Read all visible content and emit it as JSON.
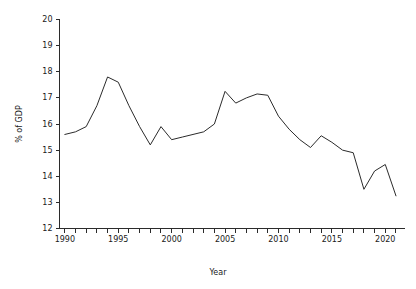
{
  "chart_data": {
    "type": "line",
    "title": "",
    "xlabel": "Year",
    "ylabel": "% of GDP",
    "xlim": [
      1989.5,
      2021.8
    ],
    "ylim": [
      12,
      20
    ],
    "grid": false,
    "legend": "none",
    "x_tick_labels": [
      "1990",
      "1995",
      "2000",
      "2005",
      "2010",
      "2015",
      "2020"
    ],
    "x_tick_label_values": [
      1990,
      1995,
      2000,
      2005,
      2010,
      2015,
      2020
    ],
    "x_minor_ticks": [
      1990,
      1991,
      1992,
      1993,
      1994,
      1995,
      1996,
      1997,
      1998,
      1999,
      2000,
      2001,
      2002,
      2003,
      2004,
      2005,
      2006,
      2007,
      2008,
      2009,
      2010,
      2011,
      2012,
      2013,
      2014,
      2015,
      2016,
      2017,
      2018,
      2019,
      2020,
      2021
    ],
    "y_tick_labels": [
      "12",
      "13",
      "14",
      "15",
      "16",
      "17",
      "18",
      "19",
      "20"
    ],
    "y_tick_values": [
      12,
      13,
      14,
      15,
      16,
      17,
      18,
      19,
      20
    ],
    "line_color": "#2b2b2b",
    "x": [
      1990,
      1991,
      1992,
      1993,
      1994,
      1995,
      1996,
      1997,
      1998,
      1999,
      2000,
      2001,
      2002,
      2003,
      2004,
      2005,
      2006,
      2007,
      2008,
      2009,
      2010,
      2011,
      2012,
      2013,
      2014,
      2015,
      2016,
      2017,
      2018,
      2019,
      2020,
      2021
    ],
    "values": [
      15.6,
      15.7,
      15.9,
      16.7,
      17.8,
      17.6,
      16.7,
      15.9,
      15.2,
      15.9,
      15.4,
      15.5,
      15.6,
      15.7,
      16.0,
      17.25,
      16.8,
      17.0,
      17.15,
      17.1,
      16.3,
      15.8,
      15.4,
      15.1,
      15.55,
      15.3,
      15.0,
      14.9,
      13.5,
      14.2,
      14.45,
      13.25
    ],
    "series": [
      {
        "name": "% of GDP",
        "values": [
          15.6,
          15.7,
          15.9,
          16.7,
          17.8,
          17.6,
          16.7,
          15.9,
          15.2,
          15.9,
          15.4,
          15.5,
          15.6,
          15.7,
          16.0,
          17.25,
          16.8,
          17.0,
          17.15,
          17.1,
          16.3,
          15.8,
          15.4,
          15.1,
          15.55,
          15.3,
          15.0,
          14.9,
          13.5,
          14.2,
          14.45,
          13.25
        ]
      }
    ]
  }
}
